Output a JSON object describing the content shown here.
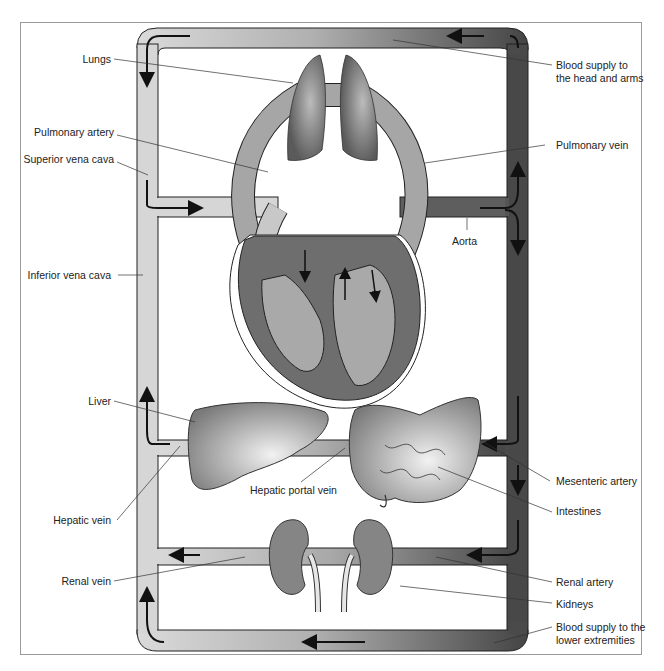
{
  "colors": {
    "venous": "#d6d6d6",
    "arterial": "#4b4b4b",
    "organ": "#7d7d7d",
    "heart_wall": "#6e6e6e",
    "heart_chamber": "#a9a9a9",
    "outline": "#1a1a1a",
    "frame": "#9a9a9a",
    "label_text": "#222222"
  },
  "labels": {
    "left": [
      {
        "id": "lungs",
        "text": "Lungs"
      },
      {
        "id": "pulmonary_artery",
        "text": "Pulmonary artery"
      },
      {
        "id": "superior_vena_cava",
        "text": "Superior vena cava"
      },
      {
        "id": "inferior_vena_cava",
        "text": "Inferior vena cava"
      },
      {
        "id": "liver",
        "text": "Liver"
      },
      {
        "id": "hepatic_vein",
        "text": "Hepatic vein"
      },
      {
        "id": "renal_vein",
        "text": "Renal vein"
      }
    ],
    "right": [
      {
        "id": "blood_supply_head_arms",
        "lines": [
          "Blood supply to",
          "the head and arms"
        ]
      },
      {
        "id": "pulmonary_vein",
        "text": "Pulmonary vein"
      },
      {
        "id": "mesenteric_artery",
        "text": "Mesenteric artery"
      },
      {
        "id": "intestines",
        "text": "Intestines"
      },
      {
        "id": "renal_artery",
        "text": "Renal artery"
      },
      {
        "id": "kidneys",
        "text": "Kidneys"
      },
      {
        "id": "blood_supply_lower",
        "lines": [
          "Blood supply to the",
          "lower extremities"
        ]
      }
    ],
    "center": [
      {
        "id": "aorta",
        "text": "Aorta"
      },
      {
        "id": "hepatic_portal_vein",
        "text": "Hepatic portal vein"
      }
    ]
  }
}
